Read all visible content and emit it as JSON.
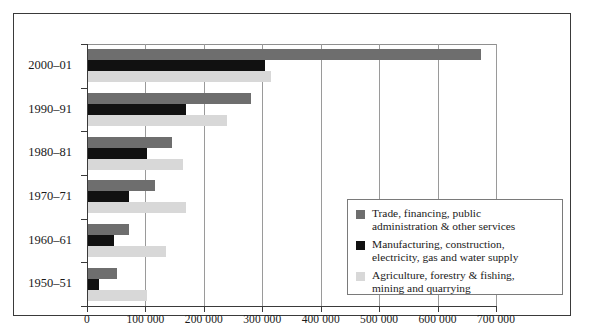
{
  "chart_data": {
    "type": "bar",
    "orientation": "horizontal",
    "title": "",
    "subtitle": "",
    "xlabel": "",
    "ylabel": "",
    "categories": [
      "2000–01",
      "1990–91",
      "1980–81",
      "1970–71",
      "1960–61",
      "1950–51"
    ],
    "series": [
      {
        "name": "Trade, financing, public administration & other services",
        "color": "#6e6e6e",
        "values": [
          674000,
          281000,
          145000,
          116000,
          72000,
          51000
        ]
      },
      {
        "name": "Manufacturing, construction, electricity, gas and water supply",
        "color": "#111111",
        "values": [
          305000,
          170000,
          103000,
          72000,
          46000,
          21000
        ]
      },
      {
        "name": "Agriculture, forestry & fishing, mining and quarrying",
        "color": "#d8d8d8",
        "values": [
          315000,
          240000,
          165000,
          170000,
          135000,
          103000
        ]
      }
    ],
    "xlim": [
      0,
      700000
    ],
    "xticks": [
      0,
      100000,
      200000,
      300000,
      400000,
      500000,
      600000,
      700000
    ],
    "xticklabels": [
      "0",
      "100 000",
      "200 000",
      "300 000",
      "400 000",
      "500 000",
      "600 000",
      "700 000"
    ],
    "grid": true,
    "grid_axis": "x",
    "legend_position": "center-right"
  },
  "legend": {
    "items": [
      {
        "line1": "Trade, financing, public",
        "line2": "administration & other services",
        "color": "#6e6e6e",
        "swatch_name": "legend-swatch-trade"
      },
      {
        "line1": "Manufacturing, construction,",
        "line2": "electricity, gas and water supply",
        "color": "#111111",
        "swatch_name": "legend-swatch-manufacturing"
      },
      {
        "line1": "Agriculture, forestry & fishing,",
        "line2": "mining and quarrying",
        "color": "#d8d8d8",
        "swatch_name": "legend-swatch-agriculture"
      }
    ]
  }
}
